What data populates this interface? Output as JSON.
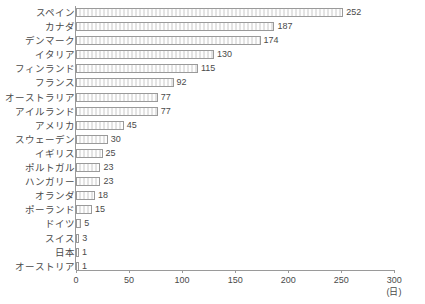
{
  "title_strip": {
    "text": "　　　　　　　　　　　　　　　　　　　　　　"
  },
  "chart_data": {
    "type": "bar",
    "orientation": "horizontal",
    "title": "",
    "xlabel": "(日)",
    "ylabel": "",
    "xlim": [
      0,
      300
    ],
    "xticks": [
      0,
      50,
      100,
      150,
      200,
      250,
      300
    ],
    "xtick_labels": [
      "0",
      "50",
      "100",
      "150",
      "200",
      "250",
      "300"
    ],
    "unit_label": "(日)",
    "grid": false,
    "legend": false,
    "categories": [
      "スペイン",
      "カナダ",
      "デンマーク",
      "イタリア",
      "フィンランド",
      "フランス",
      "オーストラリア",
      "アイルランド",
      "アメリカ",
      "スウェーデン",
      "イギリス",
      "ポルトガル",
      "ハンガリー",
      "オランダ",
      "ポーランド",
      "ドイツ",
      "スイス",
      "日本",
      "オーストリア"
    ],
    "values": [
      252,
      187,
      174,
      130,
      115,
      92,
      77,
      77,
      45,
      30,
      25,
      23,
      23,
      18,
      15,
      5,
      3,
      1,
      1
    ],
    "value_labels": [
      "252",
      "187",
      "174",
      "130",
      "115",
      "92",
      "77",
      "77",
      "45",
      "30",
      "25",
      "23",
      "23",
      "18",
      "15",
      "5",
      "3",
      "1",
      "1"
    ],
    "colors": {
      "bar_fill": "#f2f2f2",
      "bar_border": "#9a9a9a",
      "text": "#4a4a4a",
      "axis": "#9a9a9a",
      "background": "#ffffff"
    }
  }
}
